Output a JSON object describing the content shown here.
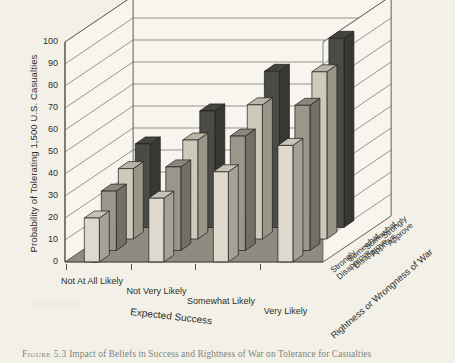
{
  "figure": {
    "caption_number": "Figure 5.3",
    "caption_text": "Impact of Beliefs in Success and Rightness of War on Tolerance for Casualties"
  },
  "chart_data": {
    "type": "bar",
    "subtype": "3d-grouped-bar",
    "title": "",
    "ylabel": "Probability of Tolerating 1,500 U.S. Casualties",
    "xlabel": "Expected Success",
    "zlabel": "Rightness or Wrongness of War",
    "ylim": [
      0,
      100
    ],
    "yticks": [
      0,
      10,
      20,
      30,
      40,
      50,
      60,
      70,
      80,
      90,
      100
    ],
    "grid": true,
    "legend": "none",
    "categories": [
      "Not At All Likely",
      "Not Very Likely",
      "Somewhat Likely",
      "Very Likely"
    ],
    "depth_categories": [
      "Strongly Disapprove",
      "Somewhat Disapprove",
      "Somewhat Approve",
      "Strongly Approve"
    ],
    "series": [
      {
        "name": "Strongly Disapprove",
        "color": "#ded9cc",
        "values": [
          20,
          29,
          41,
          53
        ]
      },
      {
        "name": "Somewhat Disapprove",
        "color": "#9a968c",
        "values": [
          27,
          38,
          52,
          66
        ]
      },
      {
        "name": "Somewhat Approve",
        "color": "#cfc9ba",
        "values": [
          32,
          45,
          61,
          76
        ]
      },
      {
        "name": "Strongly Approve",
        "color": "#4a4a47",
        "values": [
          38,
          53,
          71,
          86
        ]
      }
    ]
  },
  "colors": {
    "background": "#f3f1e7",
    "floor": "#8f8b80",
    "wall": "#f7f5ed",
    "axis": "#55534c",
    "text": "#2e2e2b"
  }
}
